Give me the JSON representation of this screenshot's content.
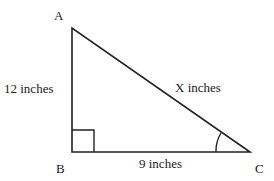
{
  "diagram": {
    "type": "right-triangle",
    "vertices": {
      "A": {
        "label": "A"
      },
      "B": {
        "label": "B"
      },
      "C": {
        "label": "C"
      }
    },
    "sides": {
      "AB": {
        "label": "12 inches"
      },
      "BC": {
        "label": "9 inches"
      },
      "AC": {
        "label": "X inches"
      }
    },
    "right_angle_at": "B",
    "marked_angle_at": "C",
    "stroke_color": "#222222"
  }
}
